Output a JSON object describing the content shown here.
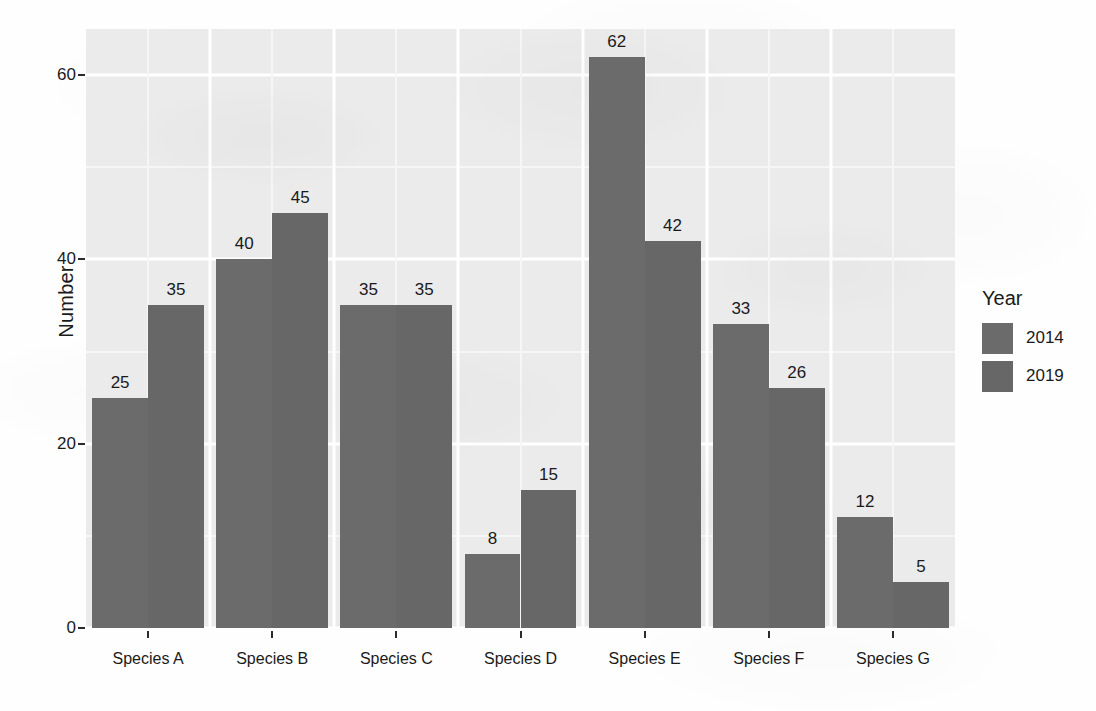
{
  "chart_data": {
    "type": "bar",
    "title": "",
    "subtitle": "",
    "xlabel": "",
    "ylabel": "Number",
    "categories": [
      "Species A",
      "Species B",
      "Species C",
      "Species D",
      "Species E",
      "Species F",
      "Species G"
    ],
    "series": [
      {
        "name": "2014",
        "values": [
          25,
          40,
          35,
          8,
          62,
          33,
          12
        ],
        "color": "#6b6b6b"
      },
      {
        "name": "2019",
        "values": [
          35,
          45,
          35,
          15,
          42,
          26,
          5
        ],
        "color": "#676767"
      }
    ],
    "legend": {
      "title": "Year",
      "position": "right",
      "entries": [
        "2014",
        "2019"
      ]
    },
    "ylim": [
      0,
      65
    ],
    "yticks": [
      0,
      20,
      40,
      60
    ],
    "ytick_labels": [
      "0",
      "20",
      "40",
      "60"
    ],
    "y_minor_ticks": [
      10,
      30,
      50
    ],
    "grid": true,
    "grid_color": "#ffffff",
    "panel_background": "#ebebeb",
    "bar_labels_shown": true,
    "bar_label_values": [
      [
        "25",
        "35"
      ],
      [
        "40",
        "45"
      ],
      [
        "35",
        "35"
      ],
      [
        "8",
        "15"
      ],
      [
        "62",
        "42"
      ],
      [
        "33",
        "26"
      ],
      [
        "12",
        "5"
      ]
    ]
  },
  "axis": {
    "y_label": "Number",
    "y_tick_0": "0",
    "y_tick_20": "20",
    "y_tick_40": "40",
    "y_tick_60": "60"
  },
  "legend": {
    "title": "Year",
    "item_2014": "2014",
    "item_2019": "2019"
  },
  "x_labels": {
    "a": "Species A",
    "b": "Species B",
    "c": "Species C",
    "d": "Species D",
    "e": "Species E",
    "f": "Species F",
    "g": "Species G"
  }
}
